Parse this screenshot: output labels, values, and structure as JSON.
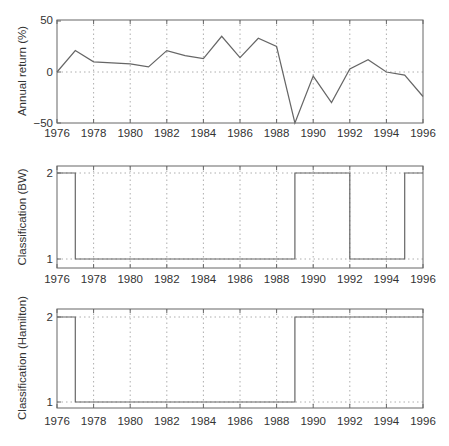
{
  "chart_data": [
    {
      "type": "line",
      "title": "",
      "xlabel": "",
      "ylabel": "Annual return (%)",
      "x": [
        1976,
        1977,
        1978,
        1979,
        1980,
        1981,
        1982,
        1983,
        1984,
        1985,
        1986,
        1987,
        1988,
        1989,
        1990,
        1991,
        1992,
        1993,
        1994,
        1995,
        1996
      ],
      "values": [
        0,
        21,
        10,
        9,
        8,
        5,
        21,
        16,
        13,
        35,
        14,
        33,
        25,
        -50,
        -4,
        -30,
        3,
        12,
        0,
        -3,
        -24
      ],
      "xlim": [
        1976,
        1996
      ],
      "ylim": [
        -50,
        50
      ],
      "xticks": [
        "1976",
        "1978",
        "1980",
        "1982",
        "1984",
        "1986",
        "1988",
        "1990",
        "1992",
        "1994",
        "1996"
      ],
      "yticks": [
        "-50",
        "0",
        "50"
      ],
      "grid": "dotted vertical at x ticks, dotted horizontal at 0"
    },
    {
      "type": "line",
      "style": "step",
      "title": "",
      "xlabel": "",
      "ylabel": "Classification (BW)",
      "x": [
        1976,
        1977,
        1978,
        1979,
        1980,
        1981,
        1982,
        1983,
        1984,
        1985,
        1986,
        1987,
        1988,
        1989,
        1990,
        1991,
        1992,
        1993,
        1994,
        1995,
        1996
      ],
      "values": [
        2,
        1,
        1,
        1,
        1,
        1,
        1,
        1,
        1,
        1,
        1,
        1,
        1,
        2,
        2,
        2,
        1,
        1,
        1,
        2,
        2
      ],
      "xlim": [
        1976,
        1996
      ],
      "ylim": [
        0.97,
        2.03
      ],
      "xticks": [
        "1976",
        "1978",
        "1980",
        "1982",
        "1984",
        "1986",
        "1988",
        "1990",
        "1992",
        "1994",
        "1996"
      ],
      "yticks": [
        "1",
        "2"
      ],
      "grid": "dotted vertical at x ticks, dotted horizontal at 1 and 2"
    },
    {
      "type": "line",
      "style": "step",
      "title": "",
      "xlabel": "",
      "ylabel": "Classification (Hamilton)",
      "x": [
        1976,
        1977,
        1978,
        1979,
        1980,
        1981,
        1982,
        1983,
        1984,
        1985,
        1986,
        1987,
        1988,
        1989,
        1990,
        1991,
        1992,
        1993,
        1994,
        1995,
        1996
      ],
      "values": [
        2,
        1,
        1,
        1,
        1,
        1,
        1,
        1,
        1,
        1,
        1,
        1,
        1,
        2,
        2,
        2,
        2,
        2,
        2,
        2,
        2
      ],
      "xlim": [
        1976,
        1996
      ],
      "ylim": [
        0.97,
        2.03
      ],
      "xticks": [
        "1976",
        "1978",
        "1980",
        "1982",
        "1984",
        "1986",
        "1988",
        "1990",
        "1992",
        "1994",
        "1996"
      ],
      "yticks": [
        "1",
        "2"
      ],
      "grid": "dotted vertical at x ticks, dotted horizontal at 1 and 2"
    }
  ],
  "labels": {
    "panel1_ylabel": "Annual return (%)",
    "panel2_ylabel": "Classification (BW)",
    "panel3_ylabel": "Classification (Hamilton)",
    "p1_y50": "50",
    "p1_y0": "0",
    "p1_yneg50": "−50",
    "p2_y2": "2",
    "p2_y1": "1",
    "p3_y2": "2",
    "p3_y1": "1",
    "xticks": [
      "1976",
      "1978",
      "1980",
      "1982",
      "1984",
      "1986",
      "1988",
      "1990",
      "1992",
      "1994",
      "1996"
    ]
  },
  "colors": {
    "line": "#666666",
    "frame": "#666666",
    "grid": "#999999",
    "text": "#333333"
  }
}
